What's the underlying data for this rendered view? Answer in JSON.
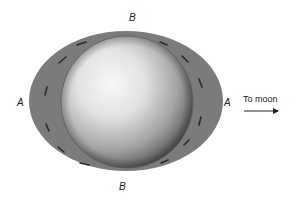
{
  "diagram": {
    "labels": {
      "top_b": "B",
      "bottom_b": "B",
      "left_a": "A",
      "right_a": "A",
      "to_moon": "To moon"
    },
    "colors": {
      "ocean_bulge": "#7a7a7a",
      "sphere_light": "#f2f2f2",
      "sphere_dark": "#4a4a4a",
      "arrow": "#2a2a2a",
      "text": "#222222"
    },
    "arrow_direction": "right"
  }
}
